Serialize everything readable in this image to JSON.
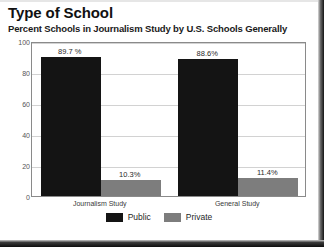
{
  "title": "Type of School",
  "subtitle": "Percent Schools in Journalism Study by U.S. Schools Generally",
  "colors": {
    "public": "#141414",
    "private": "#7d7d7d",
    "grid": "#d2d2d2",
    "axis": "#8a8a8a"
  },
  "legend": {
    "public_label": "Public",
    "private_label": "Private"
  },
  "chart_data": {
    "type": "bar",
    "title": "Type of School",
    "subtitle": "Percent Schools in Journalism Study by U.S. Schools Generally",
    "xlabel": "",
    "ylabel": "",
    "categories": [
      "Journalism Study",
      "General Study"
    ],
    "series": [
      {
        "name": "Public",
        "values": [
          89.7,
          88.6
        ],
        "labels": [
          "89.7 %",
          "88.6%"
        ]
      },
      {
        "name": "Private",
        "values": [
          10.3,
          11.4
        ],
        "labels": [
          "10.3%",
          "11.4%"
        ]
      }
    ],
    "ylim": [
      0,
      100
    ],
    "yticks": [
      0,
      20,
      40,
      60,
      80,
      100
    ],
    "ytick_labels": [
      "0",
      "20",
      "40",
      "60",
      "80",
      "100"
    ],
    "grid": true,
    "legend_position": "bottom-center"
  }
}
